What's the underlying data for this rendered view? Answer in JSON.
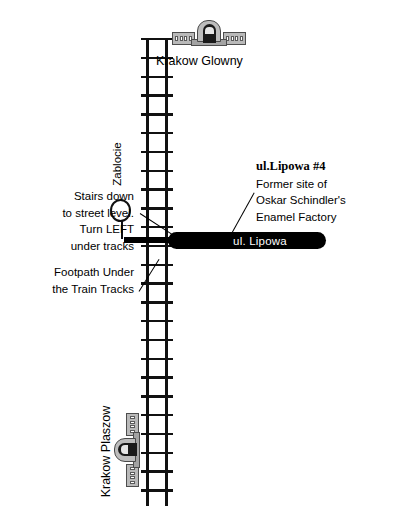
{
  "map": {
    "title": "Walking map to Oskar Schindler's Enamel Factory, Krakow",
    "stations": [
      {
        "id": "krakow-glowny",
        "label": "Krakow Glowny",
        "icon": "train-station-icon"
      },
      {
        "id": "zablocie",
        "label": "Zablocie",
        "icon": "station-circle-marker"
      },
      {
        "id": "krakow-plaszow",
        "label": "Krakow Plaszow",
        "icon": "train-station-icon"
      }
    ],
    "road": {
      "label": "ul. Lipowa",
      "color": "#000000",
      "text_color": "#ffffff"
    },
    "railway": {
      "name": "train-tracks",
      "color": "#111111"
    },
    "annotations": {
      "stairs": {
        "line1": "Stairs down",
        "line2": "to street level.",
        "line3": "Turn LEFT",
        "line4": "under tracks"
      },
      "footpath": {
        "line1": "Footpath Under",
        "line2": "the Train Tracks"
      },
      "destination": {
        "title": "ul.Lipowa #4",
        "line1": "Former site of",
        "line2": "Oskar Schindler's",
        "line3": "Enamel Factory"
      }
    }
  }
}
